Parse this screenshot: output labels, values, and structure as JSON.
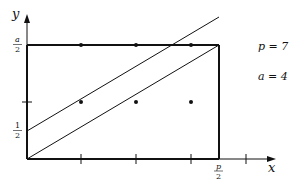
{
  "diagram": {
    "axes": {
      "x_label": "x",
      "y_label": "y"
    },
    "y_ticks": [
      {
        "num": "a",
        "den": "2",
        "italic": true
      },
      {
        "num": "1",
        "den": "2",
        "italic": false
      }
    ],
    "x_ticks": [
      {
        "num": "p",
        "den": "2",
        "italic": true
      }
    ],
    "parameters": [
      {
        "label": "p = 7"
      },
      {
        "label": "a = 4"
      }
    ],
    "colors": {
      "stroke": "#111111",
      "background": "#ffffff"
    },
    "lattice_points": [
      {
        "x": 81,
        "y": 45
      },
      {
        "x": 136,
        "y": 45
      },
      {
        "x": 191,
        "y": 45
      },
      {
        "x": 81,
        "y": 102
      },
      {
        "x": 136,
        "y": 102
      },
      {
        "x": 191,
        "y": 102
      }
    ]
  }
}
